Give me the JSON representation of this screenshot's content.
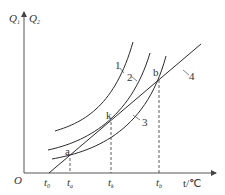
{
  "axes": {
    "y_label_1": "Q",
    "y_label_1_sub": "1",
    "y_label_2": "Q",
    "y_label_2_sub": "2",
    "origin_label": "O",
    "x_label": "t/℃"
  },
  "x_ticks": [
    {
      "main": "t",
      "sub": "0"
    },
    {
      "main": "t",
      "sub": "a"
    },
    {
      "main": "t",
      "sub": "k"
    },
    {
      "main": "t",
      "sub": "b"
    }
  ],
  "points": {
    "a": "a",
    "k": "k",
    "b": "b"
  },
  "curve_labels": {
    "c1": "1",
    "c2": "2",
    "c3": "3",
    "c4": "4"
  },
  "colors": {
    "line": "#2a2a2a",
    "axis": "#555555",
    "text": "#333333"
  }
}
